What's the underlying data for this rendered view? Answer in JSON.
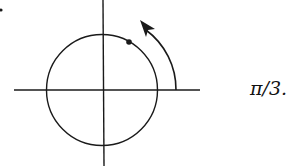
{
  "diagram": {
    "type": "unit-circle-angle",
    "angle_label": "π/3.",
    "colors": {
      "stroke": "#1a1a1a",
      "background": "#ffffff"
    },
    "elements": {
      "x_axis": true,
      "y_axis": true,
      "circle": true,
      "point_on_circle_angle": "π/3",
      "rotation_arrow": "counterclockwise"
    }
  }
}
